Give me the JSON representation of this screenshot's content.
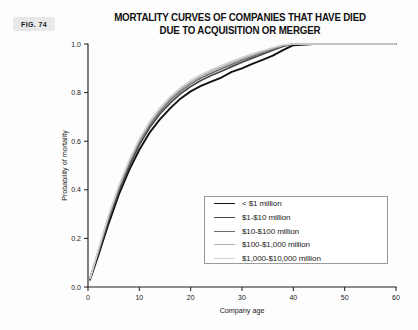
{
  "figure": {
    "badge": "FIG. 74",
    "title_line1": "MORTALITY CURVES OF COMPANIES THAT HAVE DIED",
    "title_line2": "DUE TO ACQUISITION OR MERGER"
  },
  "chart_data": {
    "type": "line",
    "title": "MORTALITY CURVES OF COMPANIES THAT HAVE DIED DUE TO ACQUISITION OR MERGER",
    "xlabel": "Company age",
    "ylabel": "Probability of mortality",
    "xlim": [
      0,
      60
    ],
    "ylim": [
      0.0,
      1.0
    ],
    "xticks": [
      0,
      10,
      20,
      30,
      40,
      50,
      60
    ],
    "xtick_labels": [
      "0",
      "10",
      "20",
      "30",
      "40",
      "50",
      "60"
    ],
    "yticks": [
      0.0,
      0.2,
      0.4,
      0.6,
      0.8,
      1.0
    ],
    "ytick_labels": [
      "0.0",
      "0.2",
      "0.4",
      "0.6",
      "0.8",
      "1.0"
    ],
    "grid": false,
    "legend_position": "lower-right",
    "series": [
      {
        "name": "< $1 million",
        "color": "#111111",
        "width": 1.9,
        "x": [
          0.4,
          2,
          4,
          6,
          8,
          10,
          12,
          14,
          16,
          18,
          20,
          22,
          24,
          26,
          28,
          30,
          32,
          34,
          36,
          38,
          40,
          44,
          48,
          52,
          56,
          60
        ],
        "y": [
          0.03,
          0.13,
          0.26,
          0.38,
          0.48,
          0.565,
          0.635,
          0.69,
          0.735,
          0.775,
          0.805,
          0.828,
          0.845,
          0.862,
          0.885,
          0.9,
          0.918,
          0.935,
          0.952,
          0.975,
          0.995,
          1.0,
          1.0,
          1.0,
          1.0,
          1.0
        ]
      },
      {
        "name": "$1-$10 million",
        "color": "#4a4a4a",
        "width": 1.7,
        "x": [
          0.4,
          2,
          4,
          6,
          8,
          10,
          12,
          14,
          16,
          18,
          20,
          22,
          24,
          26,
          28,
          30,
          32,
          34,
          36,
          38,
          40,
          44,
          48,
          52,
          56,
          60
        ],
        "y": [
          0.035,
          0.14,
          0.275,
          0.395,
          0.495,
          0.585,
          0.655,
          0.712,
          0.757,
          0.795,
          0.825,
          0.85,
          0.87,
          0.888,
          0.907,
          0.925,
          0.942,
          0.958,
          0.974,
          0.99,
          1.0,
          1.0,
          1.0,
          1.0,
          1.0,
          1.0
        ]
      },
      {
        "name": "$10-$100 million",
        "color": "#6e6e6e",
        "width": 1.6,
        "x": [
          0.4,
          2,
          4,
          6,
          8,
          10,
          12,
          14,
          16,
          18,
          20,
          22,
          24,
          26,
          28,
          30,
          32,
          34,
          36,
          38,
          40,
          44,
          48,
          52,
          56,
          60
        ],
        "y": [
          0.035,
          0.145,
          0.285,
          0.405,
          0.508,
          0.595,
          0.665,
          0.722,
          0.768,
          0.806,
          0.836,
          0.86,
          0.88,
          0.898,
          0.916,
          0.933,
          0.949,
          0.964,
          0.979,
          0.993,
          1.0,
          1.0,
          1.0,
          1.0,
          1.0,
          1.0
        ]
      },
      {
        "name": "$100-$1,000 million",
        "color": "#aeaeae",
        "width": 1.5,
        "x": [
          0.4,
          2,
          4,
          6,
          8,
          10,
          12,
          14,
          16,
          18,
          20,
          22,
          24,
          26,
          28,
          30,
          32,
          34,
          36,
          38,
          40,
          44,
          48,
          52,
          56,
          60
        ],
        "y": [
          0.035,
          0.15,
          0.29,
          0.412,
          0.515,
          0.603,
          0.674,
          0.73,
          0.776,
          0.814,
          0.844,
          0.868,
          0.888,
          0.906,
          0.923,
          0.94,
          0.955,
          0.969,
          0.982,
          0.995,
          1.0,
          1.0,
          1.0,
          1.0,
          1.0,
          1.0
        ]
      },
      {
        "name": "$1,000-$10,000 million",
        "color": "#d2d2d2",
        "width": 1.4,
        "x": [
          0.4,
          2,
          4,
          6,
          8,
          10,
          12,
          14,
          16,
          18,
          20,
          22,
          24,
          26,
          28,
          30,
          32,
          34,
          36,
          38,
          40,
          44,
          48,
          52,
          56,
          60
        ],
        "y": [
          0.035,
          0.152,
          0.295,
          0.418,
          0.522,
          0.61,
          0.681,
          0.737,
          0.783,
          0.82,
          0.85,
          0.874,
          0.894,
          0.912,
          0.929,
          0.945,
          0.96,
          0.973,
          0.985,
          0.997,
          1.0,
          1.0,
          1.0,
          1.0,
          1.0,
          1.0
        ]
      }
    ]
  }
}
